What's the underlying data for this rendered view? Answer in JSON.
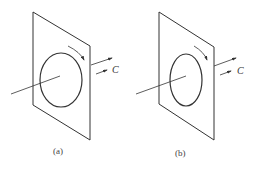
{
  "panels": [
    {
      "id": "a",
      "label": "(a)",
      "vector_label": "C"
    },
    {
      "id": "b",
      "label": "(b)",
      "vector_label": "C"
    }
  ],
  "colors": {
    "line": "#333333",
    "background": "#ffffff"
  }
}
